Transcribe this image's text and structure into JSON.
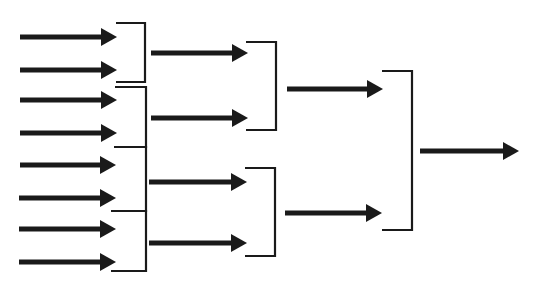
{
  "diagram": {
    "type": "tournament-bracket",
    "colors": {
      "stroke": "#1a1a1a",
      "background": "#ffffff"
    },
    "rounds": [
      {
        "name": "round-1",
        "arrows": [
          {
            "x1": 20,
            "x2": 117,
            "y": 37
          },
          {
            "x1": 20,
            "x2": 117,
            "y": 70
          },
          {
            "x1": 20,
            "x2": 117,
            "y": 100
          },
          {
            "x1": 20,
            "x2": 117,
            "y": 133
          },
          {
            "x1": 20,
            "x2": 116,
            "y": 165
          },
          {
            "x1": 19,
            "x2": 116,
            "y": 198
          },
          {
            "x1": 19,
            "x2": 116,
            "y": 229
          },
          {
            "x1": 19,
            "x2": 116,
            "y": 262
          }
        ],
        "brackets": [
          {
            "x_left": 116,
            "x_right": 145,
            "y_top": 23,
            "y_bottom": 82
          },
          {
            "x_left": 115,
            "x_right": 146,
            "y_top": 87,
            "y_bottom": 147
          },
          {
            "x_left": 114,
            "x_right": 146,
            "y_top": 147,
            "y_bottom": 211
          },
          {
            "x_left": 111,
            "x_right": 146,
            "y_top": 211,
            "y_bottom": 271
          }
        ]
      },
      {
        "name": "round-2",
        "arrows": [
          {
            "x1": 151,
            "x2": 248,
            "y": 53
          },
          {
            "x1": 151,
            "x2": 248,
            "y": 118
          },
          {
            "x1": 149,
            "x2": 247,
            "y": 182
          },
          {
            "x1": 149,
            "x2": 247,
            "y": 243
          }
        ],
        "brackets": [
          {
            "x_left": 246,
            "x_right": 276,
            "y_top": 42,
            "y_bottom": 130
          },
          {
            "x_left": 245,
            "x_right": 275,
            "y_top": 168,
            "y_bottom": 256
          }
        ]
      },
      {
        "name": "round-3",
        "arrows": [
          {
            "x1": 287,
            "x2": 383,
            "y": 89
          },
          {
            "x1": 285,
            "x2": 382,
            "y": 213
          }
        ],
        "brackets": [
          {
            "x_left": 382,
            "x_right": 412,
            "y_top": 71,
            "y_bottom": 230
          }
        ]
      },
      {
        "name": "final",
        "arrows": [
          {
            "x1": 420,
            "x2": 519,
            "y": 151
          }
        ],
        "brackets": []
      }
    ]
  }
}
